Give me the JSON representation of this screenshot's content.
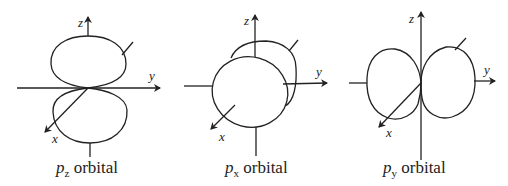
{
  "diagrams": [
    {
      "id": "pz",
      "axes": {
        "x": "x",
        "y": "y",
        "z": "z"
      },
      "caption": {
        "symbol": "p",
        "subscript": "z",
        "text": "orbital"
      }
    },
    {
      "id": "px",
      "axes": {
        "x": "x",
        "y": "y",
        "z": "z"
      },
      "caption": {
        "symbol": "p",
        "subscript": "x",
        "text": "orbital"
      }
    },
    {
      "id": "py",
      "axes": {
        "x": "x",
        "y": "y",
        "z": "z"
      },
      "caption": {
        "symbol": "p",
        "subscript": "y",
        "text": "orbital"
      }
    }
  ],
  "colors": {
    "stroke": "#222222",
    "background": "#ffffff"
  }
}
